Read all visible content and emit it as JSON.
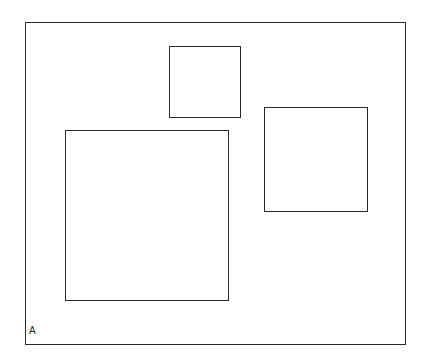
{
  "diagram": {
    "frame_label": "A",
    "stroke_color": "#2a2a2a",
    "background": "#ffffff",
    "frame": {
      "x": 25,
      "y": 22,
      "w": 381,
      "h": 323
    },
    "squares": [
      {
        "name": "small-square",
        "x": 169,
        "y": 46,
        "w": 72,
        "h": 72
      },
      {
        "name": "right-square",
        "x": 264,
        "y": 107,
        "w": 104,
        "h": 105
      },
      {
        "name": "large-square",
        "x": 65,
        "y": 130,
        "w": 164,
        "h": 171
      }
    ]
  }
}
